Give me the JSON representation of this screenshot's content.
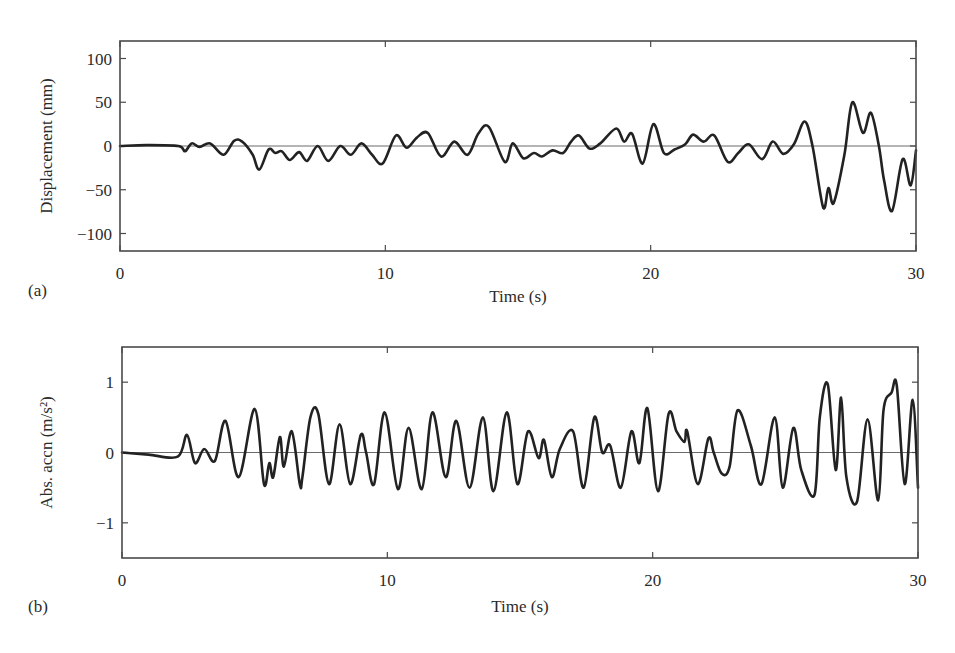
{
  "figure": {
    "panels": [
      {
        "tag": "(a)"
      },
      {
        "tag": "(b)"
      }
    ]
  },
  "chart_data": [
    {
      "type": "line",
      "panel": "(a)",
      "title": "",
      "xlabel": "Time (s)",
      "ylabel": "Displacement (mm)",
      "xlim": [
        0,
        30
      ],
      "ylim": [
        -120,
        120
      ],
      "xticks": [
        0,
        10,
        20,
        30
      ],
      "xtick_labels": [
        "0",
        "10",
        "20",
        "30"
      ],
      "yticks": [
        100,
        50,
        0,
        -50,
        -100
      ],
      "ytick_labels": [
        "100",
        "50",
        "0",
        "−50",
        "−100"
      ],
      "grid": false,
      "zero_line": true,
      "legend": null,
      "series": [
        {
          "name": "Displacement",
          "color": "#222222",
          "x": [
            0,
            1.0,
            2.2,
            2.45,
            2.7,
            3.0,
            3.4,
            3.9,
            4.3,
            4.6,
            5.0,
            5.25,
            5.6,
            5.85,
            6.1,
            6.4,
            6.75,
            7.05,
            7.45,
            7.85,
            8.3,
            8.7,
            9.1,
            9.5,
            9.9,
            10.4,
            10.8,
            11.2,
            11.6,
            12.1,
            12.6,
            13.1,
            13.5,
            13.9,
            14.5,
            14.8,
            15.2,
            15.6,
            15.9,
            16.3,
            16.7,
            17.0,
            17.3,
            17.7,
            18.1,
            18.7,
            19.0,
            19.3,
            19.7,
            20.1,
            20.5,
            20.9,
            21.3,
            21.6,
            22.0,
            22.4,
            22.9,
            23.3,
            23.7,
            24.2,
            24.6,
            25.0,
            25.4,
            25.8,
            26.1,
            26.5,
            26.7,
            26.9,
            27.3,
            27.6,
            28.0,
            28.3,
            28.6,
            28.8,
            29.1,
            29.5,
            29.8,
            30.0
          ],
          "y": [
            0,
            1,
            0,
            -6,
            3,
            -1,
            3,
            -10,
            6,
            5,
            -10,
            -27,
            -4,
            -8,
            -6,
            -16,
            -7,
            -17,
            0,
            -17,
            0,
            -10,
            3,
            -10,
            -20,
            12,
            -2,
            10,
            15,
            -12,
            5,
            -10,
            14,
            22,
            -18,
            3,
            -14,
            -8,
            -12,
            -5,
            -8,
            5,
            12,
            -3,
            3,
            20,
            5,
            14,
            -20,
            25,
            -8,
            -4,
            2,
            13,
            5,
            12,
            -18,
            -8,
            2,
            -15,
            5,
            -9,
            2,
            28,
            0,
            -70,
            -48,
            -65,
            -10,
            50,
            15,
            38,
            0,
            -40,
            -74,
            -15,
            -45,
            -5
          ]
        }
      ]
    },
    {
      "type": "line",
      "panel": "(b)",
      "title": "",
      "xlabel": "Time (s)",
      "ylabel": "Abs. accn (m/s²)",
      "xlim": [
        0,
        30
      ],
      "ylim": [
        -1.5,
        1.5
      ],
      "xticks": [
        0,
        10,
        20,
        30
      ],
      "xtick_labels": [
        "0",
        "10",
        "20",
        "30"
      ],
      "yticks": [
        1,
        0,
        -1
      ],
      "ytick_labels": [
        "1",
        "0",
        "−1"
      ],
      "grid": false,
      "zero_line": true,
      "legend": null,
      "series": [
        {
          "name": "Absolute acceleration",
          "color": "#222222",
          "x": [
            0,
            1.0,
            2.1,
            2.45,
            2.75,
            3.1,
            3.5,
            3.9,
            4.4,
            5.0,
            5.35,
            5.55,
            5.7,
            5.95,
            6.1,
            6.4,
            6.7,
            6.8,
            7.1,
            7.4,
            7.8,
            8.2,
            8.6,
            9.0,
            9.2,
            9.5,
            9.9,
            10.4,
            10.8,
            11.3,
            11.7,
            12.2,
            12.6,
            13.1,
            13.6,
            14.0,
            14.5,
            14.9,
            15.3,
            15.7,
            15.9,
            16.2,
            16.5,
            17.0,
            17.4,
            17.8,
            18.1,
            18.4,
            18.8,
            19.2,
            19.5,
            19.8,
            20.2,
            20.6,
            20.9,
            21.2,
            21.3,
            21.7,
            22.1,
            22.3,
            22.6,
            22.9,
            23.2,
            23.7,
            24.1,
            24.6,
            24.9,
            25.3,
            25.6,
            26.1,
            26.3,
            26.6,
            26.9,
            27.1,
            27.3,
            27.7,
            28.1,
            28.5,
            28.7,
            29.0,
            29.2,
            29.5,
            29.8,
            30.0
          ],
          "y": [
            0,
            -0.03,
            -0.06,
            0.25,
            -0.15,
            0.05,
            -0.12,
            0.45,
            -0.35,
            0.62,
            -0.45,
            -0.15,
            -0.35,
            0.22,
            -0.2,
            0.3,
            -0.45,
            -0.35,
            0.5,
            0.55,
            -0.45,
            0.4,
            -0.45,
            0.25,
            0.0,
            -0.45,
            0.57,
            -0.52,
            0.35,
            -0.52,
            0.57,
            -0.35,
            0.45,
            -0.5,
            0.5,
            -0.55,
            0.57,
            -0.45,
            0.3,
            -0.08,
            0.18,
            -0.35,
            0.05,
            0.3,
            -0.5,
            0.5,
            0.0,
            0.1,
            -0.5,
            0.3,
            -0.15,
            0.63,
            -0.55,
            0.55,
            0.3,
            0.15,
            0.3,
            -0.45,
            0.2,
            0.0,
            -0.3,
            -0.2,
            0.6,
            0.1,
            -0.45,
            0.5,
            -0.5,
            0.35,
            -0.25,
            -0.6,
            0.5,
            0.97,
            -0.25,
            0.78,
            -0.35,
            -0.7,
            0.47,
            -0.68,
            0.6,
            0.85,
            0.95,
            -0.45,
            0.75,
            -0.5
          ]
        }
      ]
    }
  ],
  "layout_px": {
    "panels": [
      {
        "left": 120,
        "right": 916,
        "top": 41,
        "bottom": 251,
        "tag_x": 28,
        "tag_y": 296,
        "xlabel_y": 302,
        "ylabel_x": 52
      },
      {
        "left": 122,
        "right": 918,
        "top": 347,
        "bottom": 558,
        "tag_x": 28,
        "tag_y": 612,
        "xlabel_y": 612,
        "ylabel_x": 52
      }
    ]
  }
}
